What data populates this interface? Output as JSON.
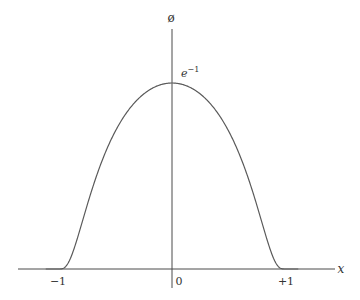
{
  "chart_data": {
    "type": "line",
    "title": "",
    "function": "bump function: phi(x) = exp(-1/(1-x^2)) for |x|<1, 0 otherwise",
    "xlabel": "x",
    "ylabel": "ø",
    "xlim": [
      -1.5,
      1.4
    ],
    "ylim": [
      0,
      0.45
    ],
    "grid": false,
    "legend": null,
    "x_ticks": [
      {
        "value": -1,
        "label": "−1"
      },
      {
        "value": 0,
        "label": "0"
      },
      {
        "value": 1,
        "label": "+1"
      }
    ],
    "annotations": [
      {
        "text": "e",
        "superscript": "−1",
        "at": [
          0,
          0.3679
        ],
        "meaning": "peak value e^-1"
      }
    ],
    "series": [
      {
        "name": "ø(x)",
        "x": [
          -1.3,
          -1.0,
          -0.95,
          -0.9,
          -0.8,
          -0.7,
          -0.6,
          -0.5,
          -0.4,
          -0.3,
          -0.2,
          -0.1,
          0.0,
          0.1,
          0.2,
          0.3,
          0.4,
          0.5,
          0.6,
          0.7,
          0.8,
          0.9,
          0.95,
          1.0,
          1.3
        ],
        "values": [
          0,
          0,
          0.0,
          0.0051,
          0.0622,
          0.1402,
          0.2096,
          0.2636,
          0.3035,
          0.3322,
          0.3513,
          0.3642,
          0.3679,
          0.3642,
          0.3513,
          0.3322,
          0.3035,
          0.2636,
          0.2096,
          0.1402,
          0.0622,
          0.0051,
          0.0,
          0,
          0
        ]
      }
    ]
  },
  "labels": {
    "y_axis": "ø",
    "x_axis": "x",
    "peak": "e",
    "peak_sup": "−1",
    "tick_neg1": "−1",
    "tick_zero": "0",
    "tick_pos1": "+1"
  }
}
